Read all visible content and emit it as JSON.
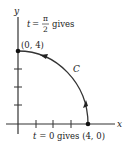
{
  "figure": {
    "axes": {
      "x_label": "x",
      "y_label": "y"
    },
    "curve": {
      "label": "C",
      "description": "quarter circle of radius 4 traversed counterclockwise from (4, 0) to (0, 4)"
    },
    "start_point": {
      "label": "(4, 0)",
      "annotation_param": "t",
      "annotation_eq": "= 0 gives",
      "annotation_full": "t = 0 gives (4, 0)"
    },
    "end_point": {
      "label": "(0, 4)",
      "annotation_param": "t",
      "annotation_eq": "=",
      "annotation_num": "π",
      "annotation_den": "2",
      "annotation_suffix": "gives"
    },
    "colors": {
      "line": "#333333",
      "text": "#222222",
      "background": "#ffffff"
    }
  }
}
